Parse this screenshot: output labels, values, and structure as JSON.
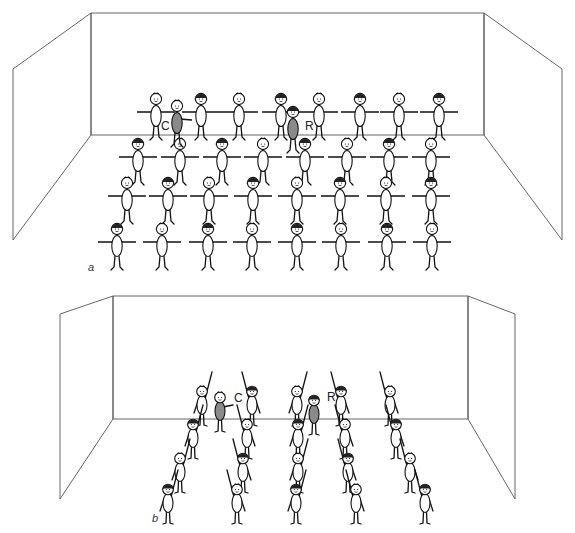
{
  "panels": [
    {
      "id": "a",
      "label": "a",
      "label_pos": [
        88,
        271
      ],
      "room": {
        "back_wall": [
          [
            91,
            13
          ],
          [
            484,
            13
          ],
          [
            484,
            135
          ],
          [
            91,
            135
          ]
        ],
        "left_wall": [
          [
            13,
            69
          ],
          [
            91,
            13
          ],
          [
            91,
            135
          ],
          [
            13,
            240
          ]
        ],
        "right_wall": [
          [
            484,
            13
          ],
          [
            562,
            69
          ],
          [
            562,
            240
          ],
          [
            484,
            135
          ]
        ]
      },
      "formation": "grid",
      "pose": "arms-out",
      "rows": [
        {
          "y": 113,
          "xs": [
            156,
            201,
            239,
            281,
            319,
            360,
            399,
            439
          ]
        },
        {
          "y": 158,
          "xs": [
            138,
            180,
            222,
            263,
            305,
            347,
            389,
            431
          ]
        },
        {
          "y": 197,
          "xs": [
            127,
            168,
            209,
            253,
            297,
            340,
            386,
            431
          ]
        },
        {
          "y": 243,
          "xs": [
            117,
            162,
            208,
            252,
            297,
            341,
            387,
            432
          ]
        }
      ],
      "special": [
        {
          "id": "C",
          "label": "C",
          "x": 177,
          "y": 120,
          "shaded": true,
          "facing": "right",
          "label_dx": -16,
          "label_dy": 10
        },
        {
          "id": "R",
          "label": "R",
          "x": 293,
          "y": 126,
          "shaded": true,
          "facing": "left",
          "label_dx": 12,
          "label_dy": 4
        }
      ]
    },
    {
      "id": "b",
      "label": "b",
      "label_pos": [
        152,
        522
      ],
      "room": {
        "back_wall": [
          [
            113,
            296
          ],
          [
            468,
            296
          ],
          [
            468,
            419
          ],
          [
            113,
            419
          ]
        ],
        "left_wall": [
          [
            60,
            314
          ],
          [
            113,
            296
          ],
          [
            113,
            419
          ],
          [
            60,
            499
          ]
        ],
        "right_wall": [
          [
            468,
            296
          ],
          [
            515,
            314
          ],
          [
            515,
            499
          ],
          [
            468,
            419
          ]
        ]
      },
      "formation": "columns",
      "pose": "arm-raised",
      "columns": [
        {
          "side": "left",
          "points": [
            [
              202,
              404
            ],
            [
              193,
              437
            ],
            [
              180,
              471
            ],
            [
              168,
              502
            ]
          ]
        },
        {
          "side": "right",
          "points": [
            [
              252,
              404
            ],
            [
              247,
              437
            ],
            [
              243,
              471
            ],
            [
              237,
              502
            ]
          ]
        },
        {
          "side": "left",
          "points": [
            [
              297,
              404
            ],
            [
              298,
              437
            ],
            [
              298,
              471
            ],
            [
              296,
              502
            ]
          ]
        },
        {
          "side": "right",
          "points": [
            [
              341,
              404
            ],
            [
              345,
              437
            ],
            [
              348,
              471
            ],
            [
              356,
              502
            ]
          ]
        },
        {
          "side": "right",
          "points": [
            [
              390,
              404
            ],
            [
              396,
              437
            ],
            [
              410,
              471
            ],
            [
              425,
              502
            ]
          ]
        }
      ],
      "special": [
        {
          "id": "C",
          "label": "C",
          "x": 220,
          "y": 410,
          "shaded": true,
          "facing": "right",
          "label_dx": 14,
          "label_dy": -8
        },
        {
          "id": "R",
          "label": "R",
          "x": 314,
          "y": 413,
          "shaded": true,
          "facing": "front",
          "label_dx": 13,
          "label_dy": -12
        }
      ]
    }
  ]
}
